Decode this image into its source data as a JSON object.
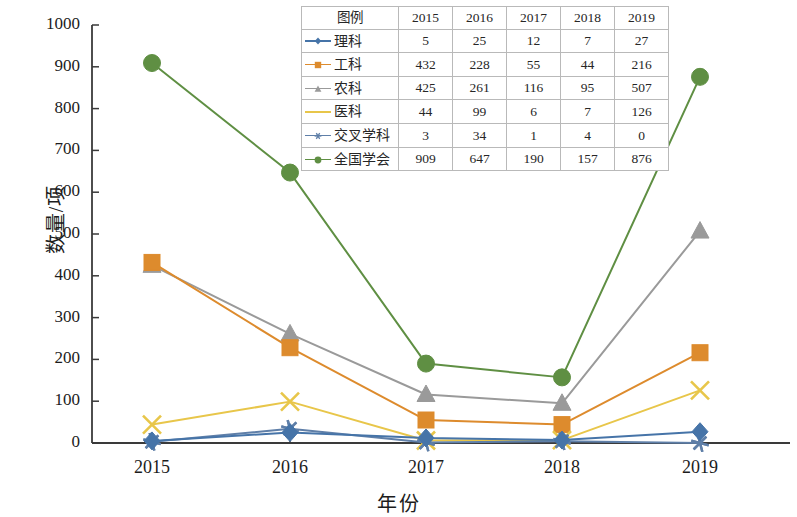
{
  "chart_data": {
    "type": "line",
    "title": "",
    "xlabel": "年份",
    "ylabel": "数量/项",
    "categories": [
      "2015",
      "2016",
      "2017",
      "2018",
      "2019"
    ],
    "x": [
      2015,
      2016,
      2017,
      2018,
      2019
    ],
    "ylim": [
      0,
      1000
    ],
    "yticks": [
      "0",
      "100",
      "200",
      "300",
      "400",
      "500",
      "600",
      "700",
      "800",
      "900",
      "1000"
    ],
    "ytick_values": [
      0,
      100,
      200,
      300,
      400,
      500,
      600,
      700,
      800,
      900,
      1000
    ],
    "grid": false,
    "legend_position": "inside-top-center-table",
    "series": [
      {
        "name": "理科",
        "values": [
          5,
          25,
          12,
          7,
          27
        ],
        "color": "#4674a8",
        "marker": "diamond"
      },
      {
        "name": "工科",
        "values": [
          432,
          228,
          55,
          44,
          216
        ],
        "color": "#dd8b2d",
        "marker": "square"
      },
      {
        "name": "农科",
        "values": [
          425,
          261,
          116,
          95,
          507
        ],
        "color": "#9a9a9a",
        "marker": "triangle"
      },
      {
        "name": "医科",
        "values": [
          44,
          99,
          6,
          7,
          126
        ],
        "color": "#e8c64a",
        "marker": "cross"
      },
      {
        "name": "交叉学科",
        "values": [
          3,
          34,
          1,
          4,
          0
        ],
        "color": "#5f7fa8",
        "marker": "asterisk"
      },
      {
        "name": "全国学会",
        "values": [
          909,
          647,
          190,
          157,
          876
        ],
        "color": "#5f8f43",
        "marker": "circle"
      }
    ]
  },
  "legend_table": {
    "header": [
      "图例",
      "2015",
      "2016",
      "2017",
      "2018",
      "2019"
    ],
    "rows": [
      {
        "label": "理科",
        "values": [
          "5",
          "25",
          "12",
          "7",
          "27"
        ]
      },
      {
        "label": "工科",
        "values": [
          "432",
          "228",
          "55",
          "44",
          "216"
        ]
      },
      {
        "label": "农科",
        "values": [
          "425",
          "261",
          "116",
          "95",
          "507"
        ]
      },
      {
        "label": "医科",
        "values": [
          "44",
          "99",
          "6",
          "7",
          "126"
        ]
      },
      {
        "label": "交叉学科",
        "values": [
          "3",
          "34",
          "1",
          "4",
          "0"
        ]
      },
      {
        "label": "全国学会",
        "values": [
          "909",
          "647",
          "190",
          "157",
          "876"
        ]
      }
    ]
  },
  "axes": {
    "y_title": "数量/项",
    "x_title": "年份",
    "y_labels": [
      "1000",
      "900",
      "800",
      "700",
      "600",
      "500",
      "400",
      "300",
      "200",
      "100",
      "0"
    ],
    "x_labels": [
      "2015",
      "2016",
      "2017",
      "2018",
      "2019"
    ]
  },
  "colors": {
    "like": "#4674a8",
    "gong": "#dd8b2d",
    "nong": "#9a9a9a",
    "yi": "#e8c64a",
    "jiaocha": "#5f7fa8",
    "xuehui": "#5f8f43",
    "axis": "#3a3a3a",
    "table_border": "#b9b9b9"
  }
}
